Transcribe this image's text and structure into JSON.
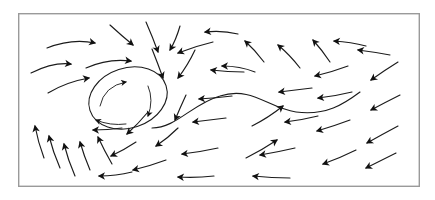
{
  "figure": {
    "title": "",
    "kind": "vector-field-streamline-diagram",
    "background_color": "#ffffff",
    "stroke_color": "#1b1b1b",
    "frame_color": "#9a9a9a",
    "frame": {
      "x": 18,
      "y": 13,
      "width": 402,
      "height": 174
    }
  },
  "chart_data": {
    "type": "scatter",
    "title": "",
    "xlabel": "",
    "ylabel": "",
    "xlim": [
      18,
      420
    ],
    "ylim": [
      13,
      187
    ],
    "grid": false,
    "legend": "none",
    "annotations": [
      {
        "name": "vortex-core",
        "x": 128,
        "y": 98,
        "rotation": "clockwise"
      },
      {
        "name": "separatrix-s-curve",
        "x": 255,
        "y": 100
      }
    ],
    "series": [
      {
        "name": "velocity-vectors",
        "notation": "each item is one curved streamline arrow: start point, control point, end point (arrow tip) in pixel coordinates",
        "values": [
          {
            "id": 1,
            "x0": 47,
            "y0": 48,
            "cx": 72,
            "cy": 38,
            "x1": 95,
            "y1": 43
          },
          {
            "id": 2,
            "x0": 31,
            "y0": 73,
            "cx": 53,
            "cy": 62,
            "x1": 71,
            "y1": 64
          },
          {
            "id": 3,
            "x0": 86,
            "y0": 68,
            "cx": 108,
            "cy": 58,
            "x1": 131,
            "y1": 61
          },
          {
            "id": 4,
            "x0": 48,
            "y0": 93,
            "cx": 66,
            "cy": 82,
            "x1": 89,
            "y1": 78
          },
          {
            "id": 5,
            "x0": 110,
            "y0": 25,
            "cx": 122,
            "cy": 36,
            "x1": 133,
            "y1": 45
          },
          {
            "id": 6,
            "x0": 146,
            "y0": 22,
            "cx": 153,
            "cy": 38,
            "x1": 158,
            "y1": 52
          },
          {
            "id": 7,
            "x0": 180,
            "y0": 26,
            "cx": 176,
            "cy": 40,
            "x1": 170,
            "y1": 50
          },
          {
            "id": 8,
            "x0": 152,
            "y0": 49,
            "cx": 158,
            "cy": 64,
            "x1": 163,
            "y1": 78
          },
          {
            "id": 9,
            "x0": 195,
            "y0": 50,
            "cx": 188,
            "cy": 65,
            "x1": 178,
            "y1": 78
          },
          {
            "id": 10,
            "x0": 213,
            "y0": 42,
            "cx": 196,
            "cy": 46,
            "x1": 178,
            "y1": 53
          },
          {
            "id": 11,
            "x0": 238,
            "y0": 34,
            "cx": 222,
            "cy": 30,
            "x1": 205,
            "y1": 32
          },
          {
            "id": 12,
            "x0": 255,
            "y0": 72,
            "cx": 240,
            "cy": 66,
            "x1": 222,
            "y1": 66
          },
          {
            "id": 13,
            "x0": 264,
            "y0": 62,
            "cx": 255,
            "cy": 50,
            "x1": 245,
            "y1": 41
          },
          {
            "id": 14,
            "x0": 300,
            "y0": 68,
            "cx": 290,
            "cy": 55,
            "x1": 278,
            "y1": 45
          },
          {
            "id": 15,
            "x0": 330,
            "y0": 62,
            "cx": 322,
            "cy": 50,
            "x1": 313,
            "y1": 40
          },
          {
            "id": 16,
            "x0": 366,
            "y0": 46,
            "cx": 351,
            "cy": 42,
            "x1": 334,
            "y1": 41
          },
          {
            "id": 17,
            "x0": 390,
            "y0": 55,
            "cx": 374,
            "cy": 52,
            "x1": 358,
            "y1": 50
          },
          {
            "id": 18,
            "x0": 398,
            "y0": 62,
            "cx": 385,
            "cy": 70,
            "x1": 371,
            "y1": 80
          },
          {
            "id": 19,
            "x0": 400,
            "y0": 95,
            "cx": 386,
            "cy": 102,
            "x1": 371,
            "y1": 110
          },
          {
            "id": 20,
            "x0": 398,
            "y0": 126,
            "cx": 383,
            "cy": 134,
            "x1": 367,
            "y1": 143
          },
          {
            "id": 21,
            "x0": 396,
            "y0": 153,
            "cx": 382,
            "cy": 160,
            "x1": 366,
            "y1": 168
          },
          {
            "id": 22,
            "x0": 356,
            "y0": 150,
            "cx": 340,
            "cy": 158,
            "x1": 323,
            "y1": 164
          },
          {
            "id": 23,
            "x0": 350,
            "y0": 120,
            "cx": 334,
            "cy": 126,
            "x1": 317,
            "y1": 131
          },
          {
            "id": 24,
            "x0": 352,
            "y0": 92,
            "cx": 336,
            "cy": 96,
            "x1": 318,
            "y1": 98
          },
          {
            "id": 25,
            "x0": 348,
            "y0": 66,
            "cx": 332,
            "cy": 72,
            "x1": 315,
            "y1": 76
          },
          {
            "id": 26,
            "x0": 318,
            "y0": 116,
            "cx": 302,
            "cy": 120,
            "x1": 285,
            "y1": 122
          },
          {
            "id": 27,
            "x0": 312,
            "y0": 88,
            "cx": 296,
            "cy": 90,
            "x1": 279,
            "y1": 92
          },
          {
            "id": 28,
            "x0": 295,
            "y0": 148,
            "cx": 278,
            "cy": 152,
            "x1": 260,
            "y1": 155
          },
          {
            "id": 29,
            "x0": 290,
            "y0": 178,
            "cx": 272,
            "cy": 178,
            "x1": 253,
            "y1": 176
          },
          {
            "id": 30,
            "x0": 252,
            "y0": 126,
            "cx": 268,
            "cy": 118,
            "x1": 283,
            "y1": 106
          },
          {
            "id": 31,
            "x0": 246,
            "y0": 158,
            "cx": 262,
            "cy": 150,
            "x1": 277,
            "y1": 140
          },
          {
            "id": 32,
            "x0": 232,
            "y0": 96,
            "cx": 216,
            "cy": 98,
            "x1": 199,
            "y1": 99
          },
          {
            "id": 33,
            "x0": 244,
            "y0": 72,
            "cx": 228,
            "cy": 72,
            "x1": 211,
            "y1": 70
          },
          {
            "id": 34,
            "x0": 226,
            "y0": 118,
            "cx": 210,
            "cy": 120,
            "x1": 193,
            "y1": 122
          },
          {
            "id": 35,
            "x0": 218,
            "y0": 148,
            "cx": 200,
            "cy": 152,
            "x1": 182,
            "y1": 154
          },
          {
            "id": 36,
            "x0": 214,
            "y0": 176,
            "cx": 196,
            "cy": 178,
            "x1": 178,
            "y1": 177
          },
          {
            "id": 37,
            "x0": 186,
            "y0": 95,
            "cx": 180,
            "cy": 108,
            "x1": 175,
            "y1": 120
          },
          {
            "id": 38,
            "x0": 178,
            "y0": 128,
            "cx": 168,
            "cy": 138,
            "x1": 156,
            "y1": 146
          },
          {
            "id": 39,
            "x0": 166,
            "y0": 160,
            "cx": 150,
            "cy": 166,
            "x1": 133,
            "y1": 170
          },
          {
            "id": 40,
            "x0": 148,
            "y0": 112,
            "cx": 138,
            "cy": 124,
            "x1": 127,
            "y1": 134
          },
          {
            "id": 41,
            "x0": 136,
            "y0": 142,
            "cx": 124,
            "cy": 150,
            "x1": 111,
            "y1": 156
          },
          {
            "id": 42,
            "x0": 132,
            "y0": 172,
            "cx": 116,
            "cy": 176,
            "x1": 99,
            "y1": 176
          },
          {
            "id": 43,
            "x0": 122,
            "y0": 128,
            "cx": 108,
            "cy": 130,
            "x1": 93,
            "y1": 130
          },
          {
            "id": 44,
            "x0": 75,
            "y0": 176,
            "cx": 68,
            "cy": 160,
            "x1": 64,
            "y1": 144
          },
          {
            "id": 45,
            "x0": 60,
            "y0": 168,
            "cx": 53,
            "cy": 152,
            "x1": 49,
            "y1": 136
          },
          {
            "id": 46,
            "x0": 44,
            "y0": 158,
            "cx": 38,
            "cy": 142,
            "x1": 35,
            "y1": 126
          },
          {
            "id": 47,
            "x0": 90,
            "y0": 170,
            "cx": 84,
            "cy": 156,
            "x1": 80,
            "y1": 142
          },
          {
            "id": 48,
            "x0": 112,
            "y0": 164,
            "cx": 104,
            "cy": 150,
            "x1": 98,
            "y1": 137
          }
        ]
      },
      {
        "name": "vortex-inner-arrows",
        "notation": "curved arrows inside the vortex core showing clockwise rotation",
        "values": [
          {
            "id": 49,
            "x0": 100,
            "y0": 106,
            "cx": 104,
            "cy": 86,
            "x1": 126,
            "y1": 82
          },
          {
            "id": 50,
            "x0": 148,
            "y0": 86,
            "cx": 154,
            "cy": 100,
            "x1": 148,
            "y1": 116
          },
          {
            "id": 51,
            "x0": 126,
            "y0": 124,
            "cx": 110,
            "cy": 126,
            "x1": 96,
            "y1": 120
          }
        ]
      }
    ],
    "long_streamlines": [
      {
        "name": "separatrix-s-curve",
        "path": "M 152,128 C 176,128 192,104 220,96 C 252,86 268,108 296,112 C 326,116 344,104 360,92"
      },
      {
        "name": "vortex-outer-ellipse",
        "cx": 128,
        "cy": 98,
        "rx": 40,
        "ry": 30,
        "rotation_deg": -18
      }
    ]
  }
}
